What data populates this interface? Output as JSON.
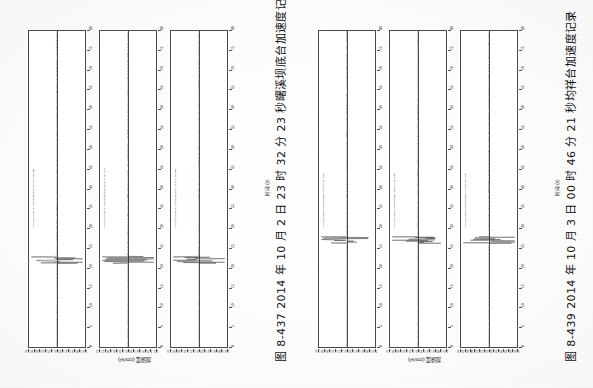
{
  "page": {
    "background_color": "#ffffff",
    "orientation": "rotated-90"
  },
  "figures": [
    {
      "id": "figure-8-437",
      "caption": "图 8-437  2014 年 10 月 2 日 23 时 32 分 23 秒曙溪坝底台加速度记录",
      "time_axis_title": "时间 (s)",
      "amp_axis_title": "加速度 (cm/s²)",
      "panels": [
        {
          "note": "Acceleration ETBJ-01 st 20141002233223 (NS) amplitude 0.885",
          "component": "NS",
          "peak_amplitude": 0.885,
          "amp_ticks": [
            "-1.0",
            "-0.8",
            "-0.6",
            "-0.4",
            "-0.2",
            "0.0",
            "0.2",
            "0.4",
            "0.6",
            "0.8",
            "1.0"
          ],
          "time_ticks": [
            "0",
            "5",
            "10",
            "15",
            "20",
            "25",
            "30",
            "35",
            "40",
            "45",
            "50",
            "55",
            "60",
            "65",
            "70",
            "75",
            "80"
          ]
        },
        {
          "note": "Acceleration ETBJ-01 st 20141002233223 (EW) amplitude 1.373",
          "component": "EW",
          "peak_amplitude": 1.373,
          "amp_ticks": [
            "-1.5",
            "-1.2",
            "-0.9",
            "-0.6",
            "-0.3",
            "0.0",
            "0.3",
            "0.6",
            "0.9",
            "1.2",
            "1.5"
          ],
          "time_ticks": [
            "0",
            "5",
            "10",
            "15",
            "20",
            "25",
            "30",
            "35",
            "40",
            "45",
            "50",
            "55",
            "60",
            "65",
            "70",
            "75",
            "80"
          ]
        },
        {
          "note": "Acceleration ETBJ-01 st 20141002233223 (UD) amplitude 0.860",
          "component": "UD",
          "peak_amplitude": 0.86,
          "amp_ticks": [
            "-1.0",
            "-0.8",
            "-0.6",
            "-0.4",
            "-0.2",
            "0.0",
            "0.2",
            "0.4",
            "0.6",
            "0.8",
            "1.0"
          ],
          "time_ticks": [
            "0",
            "5",
            "10",
            "15",
            "20",
            "25",
            "30",
            "35",
            "40",
            "45",
            "50",
            "55",
            "60",
            "65",
            "70",
            "75",
            "80"
          ]
        }
      ]
    },
    {
      "id": "figure-8-439",
      "caption": "图 8-439  2014 年 10 月 3 日 00 时 46 分 21 秒均祥台加速度记录",
      "time_axis_title": "时间 (s)",
      "amp_axis_title": "加速度 (cm/s²)",
      "panels": [
        {
          "note": "Acceleration 089 st 20141003004621 (NS) amplitude 1.008",
          "component": "NS",
          "peak_amplitude": 1.008,
          "amp_ticks": [
            "-1.0",
            "-0.8",
            "-0.6",
            "-0.4",
            "-0.2",
            "0.0",
            "0.2",
            "0.4",
            "0.6",
            "0.8",
            "1.0"
          ],
          "time_ticks": [
            "0",
            "5",
            "10",
            "15",
            "20",
            "25",
            "30",
            "35",
            "40",
            "45",
            "50",
            "55",
            "60",
            "65",
            "70",
            "75",
            "80"
          ]
        },
        {
          "note": "Acceleration 089 st 20141003004621 (EW) amplitude 0.937",
          "component": "EW",
          "peak_amplitude": 0.937,
          "amp_ticks": [
            "-1.0",
            "-0.8",
            "-0.6",
            "-0.4",
            "-0.2",
            "0.0",
            "0.2",
            "0.4",
            "0.6",
            "0.8",
            "1.0"
          ],
          "time_ticks": [
            "0",
            "5",
            "10",
            "15",
            "20",
            "25",
            "30",
            "35",
            "40",
            "45",
            "50",
            "55",
            "60",
            "65",
            "70",
            "75",
            "80"
          ]
        },
        {
          "note": "Acceleration 089 st 20141003004621 (UD) amplitude 0.546",
          "component": "UD",
          "peak_amplitude": 0.546,
          "amp_ticks": [
            "-0.6",
            "-0.5",
            "-0.4",
            "-0.3",
            "-0.2",
            "-0.1",
            "0.0",
            "0.1",
            "0.2",
            "0.3",
            "0.4",
            "0.5",
            "0.6"
          ],
          "time_ticks": [
            "0",
            "5",
            "10",
            "15",
            "20",
            "25",
            "30",
            "35",
            "40",
            "45",
            "50",
            "55",
            "60",
            "65",
            "70",
            "75",
            "80"
          ]
        }
      ]
    }
  ],
  "chart_data": {
    "type": "line",
    "xlabel": "时间 (s)",
    "ylabel": "加速度 (cm/s²)",
    "xlim": [
      0,
      80
    ],
    "grid": false,
    "legend": "none",
    "note": "Each panel is a seismogram drawn rotated 90°: time runs vertically downward→upward, acceleration runs horizontally about a zero line.",
    "series": [
      {
        "name": "ETBJ-01 20141002233223 NS",
        "figure": "图 8-437",
        "component": "NS",
        "peak_amplitude": 0.885,
        "ylim": [
          -1.0,
          1.0
        ],
        "onset_time_s": 22,
        "coda_end_time_s": 62,
        "x": [
          0,
          5,
          10,
          15,
          18,
          20,
          21,
          22,
          23,
          24,
          25,
          26,
          27,
          28,
          30,
          32,
          35,
          38,
          42,
          46,
          50,
          55,
          60,
          65,
          70,
          75,
          80
        ],
        "values": [
          0.01,
          0.01,
          0.02,
          0.03,
          0.05,
          0.12,
          0.34,
          0.88,
          0.62,
          0.8,
          0.55,
          0.74,
          0.41,
          0.52,
          0.33,
          0.28,
          0.2,
          0.16,
          0.12,
          0.09,
          0.07,
          0.05,
          0.04,
          0.03,
          0.02,
          0.02,
          0.01
        ]
      },
      {
        "name": "ETBJ-01 20141002233223 EW",
        "figure": "图 8-437",
        "component": "EW",
        "peak_amplitude": 1.373,
        "ylim": [
          -1.5,
          1.5
        ],
        "onset_time_s": 22,
        "coda_end_time_s": 60,
        "x": [
          0,
          5,
          10,
          15,
          18,
          20,
          21,
          22,
          23,
          24,
          25,
          26,
          27,
          28,
          30,
          32,
          35,
          38,
          42,
          46,
          50,
          55,
          60,
          65,
          70,
          75,
          80
        ],
        "values": [
          0.01,
          0.01,
          0.02,
          0.03,
          0.06,
          0.15,
          0.45,
          1.37,
          0.72,
          0.95,
          0.6,
          0.81,
          0.47,
          0.55,
          0.36,
          0.3,
          0.22,
          0.17,
          0.13,
          0.1,
          0.07,
          0.05,
          0.04,
          0.03,
          0.02,
          0.02,
          0.01
        ]
      },
      {
        "name": "ETBJ-01 20141002233223 UD",
        "figure": "图 8-437",
        "component": "UD",
        "peak_amplitude": 0.86,
        "ylim": [
          -1.0,
          1.0
        ],
        "onset_time_s": 22,
        "coda_end_time_s": 55,
        "x": [
          0,
          5,
          10,
          15,
          18,
          20,
          21,
          22,
          23,
          24,
          25,
          26,
          27,
          28,
          30,
          32,
          35,
          38,
          42,
          46,
          50,
          55,
          60,
          65,
          70,
          75,
          80
        ],
        "values": [
          0.01,
          0.01,
          0.01,
          0.02,
          0.04,
          0.1,
          0.4,
          0.86,
          0.5,
          0.62,
          0.44,
          0.56,
          0.33,
          0.4,
          0.26,
          0.21,
          0.15,
          0.12,
          0.09,
          0.07,
          0.05,
          0.04,
          0.03,
          0.02,
          0.02,
          0.01,
          0.01
        ]
      },
      {
        "name": "089 20141003004621 NS",
        "figure": "图 8-439",
        "component": "NS",
        "peak_amplitude": 1.008,
        "ylim": [
          -1.0,
          1.0
        ],
        "onset_time_s": 27,
        "coda_end_time_s": 50,
        "x": [
          0,
          5,
          10,
          15,
          20,
          24,
          26,
          27,
          28,
          29,
          30,
          31,
          32,
          34,
          36,
          38,
          40,
          44,
          48,
          52,
          56,
          60,
          65,
          70,
          75,
          80
        ],
        "values": [
          0.01,
          0.01,
          0.01,
          0.01,
          0.02,
          0.06,
          0.25,
          1.0,
          0.55,
          0.7,
          0.42,
          0.5,
          0.3,
          0.22,
          0.16,
          0.12,
          0.09,
          0.06,
          0.05,
          0.04,
          0.03,
          0.02,
          0.02,
          0.01,
          0.01,
          0.01
        ]
      },
      {
        "name": "089 20141003004621 EW",
        "figure": "图 8-439",
        "component": "EW",
        "peak_amplitude": 0.937,
        "ylim": [
          -1.0,
          1.0
        ],
        "onset_time_s": 27,
        "coda_end_time_s": 50,
        "x": [
          0,
          5,
          10,
          15,
          20,
          24,
          26,
          27,
          28,
          29,
          30,
          31,
          32,
          34,
          36,
          38,
          40,
          44,
          48,
          52,
          56,
          60,
          65,
          70,
          75,
          80
        ],
        "values": [
          0.01,
          0.01,
          0.01,
          0.01,
          0.02,
          0.05,
          0.22,
          0.94,
          0.5,
          0.66,
          0.39,
          0.47,
          0.28,
          0.2,
          0.15,
          0.11,
          0.08,
          0.06,
          0.04,
          0.03,
          0.03,
          0.02,
          0.02,
          0.01,
          0.01,
          0.01
        ]
      },
      {
        "name": "089 20141003004621 UD",
        "figure": "图 8-439",
        "component": "UD",
        "peak_amplitude": 0.546,
        "ylim": [
          -0.6,
          0.6
        ],
        "onset_time_s": 27,
        "coda_end_time_s": 48,
        "x": [
          0,
          5,
          10,
          15,
          20,
          24,
          26,
          27,
          28,
          29,
          30,
          31,
          32,
          34,
          36,
          38,
          40,
          44,
          48,
          52,
          56,
          60,
          65,
          70,
          75,
          80
        ],
        "values": [
          0.01,
          0.01,
          0.01,
          0.01,
          0.01,
          0.04,
          0.16,
          0.55,
          0.32,
          0.4,
          0.24,
          0.29,
          0.18,
          0.13,
          0.1,
          0.07,
          0.06,
          0.04,
          0.03,
          0.02,
          0.02,
          0.02,
          0.01,
          0.01,
          0.01,
          0.01
        ]
      }
    ]
  }
}
